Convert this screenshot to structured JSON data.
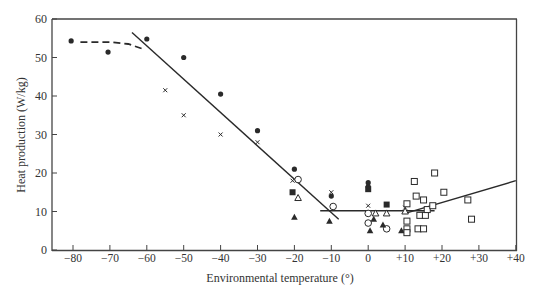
{
  "chart_data": {
    "type": "scatter",
    "title": "",
    "xlabel": "Environmental temperature (°)",
    "ylabel": "Heat production (W/kg)",
    "xlim": [
      -85,
      40
    ],
    "ylim": [
      0,
      60
    ],
    "grid": false,
    "legend": null,
    "x_ticks": [
      -80,
      -70,
      -60,
      -50,
      -40,
      -30,
      -20,
      -10,
      0,
      10,
      20,
      30,
      40
    ],
    "x_tick_labels": [
      "−80",
      "−70",
      "−60",
      "−50",
      "−40",
      "−30",
      "−20",
      "−10",
      "0",
      "+10",
      "+20",
      "+30",
      "+40"
    ],
    "y_ticks": [
      0,
      10,
      20,
      30,
      40,
      50,
      60
    ],
    "y_tick_labels": [
      "0",
      "10",
      "20",
      "30",
      "40",
      "50",
      "60"
    ],
    "series": [
      {
        "name": "filled-circle",
        "marker": "filled-circle",
        "points": [
          [
            -80.5,
            54.3
          ],
          [
            -70.5,
            51.4
          ],
          [
            -60,
            54.8
          ],
          [
            -50,
            50
          ],
          [
            -40,
            40.5
          ],
          [
            -30,
            31
          ],
          [
            -20,
            21
          ],
          [
            -10,
            14
          ],
          [
            0,
            17.5
          ],
          [
            0,
            16.5
          ]
        ]
      },
      {
        "name": "cross",
        "marker": "cross",
        "points": [
          [
            -55,
            41.5
          ],
          [
            -50,
            35
          ],
          [
            -40,
            30
          ],
          [
            -30,
            28
          ],
          [
            -20.5,
            18
          ],
          [
            -10,
            15
          ],
          [
            0,
            11.5
          ],
          [
            10,
            11
          ]
        ]
      },
      {
        "name": "open-circle",
        "marker": "open-circle",
        "points": [
          [
            -19,
            18.3
          ],
          [
            -9.5,
            11.3
          ],
          [
            0,
            9.5
          ],
          [
            0,
            7
          ],
          [
            5,
            5.5
          ]
        ]
      },
      {
        "name": "filled-square",
        "marker": "filled-square",
        "points": [
          [
            -20.5,
            15
          ],
          [
            0,
            15.8
          ],
          [
            5,
            11.8
          ]
        ]
      },
      {
        "name": "open-triangle",
        "marker": "open-triangle",
        "points": [
          [
            -19,
            13.5
          ],
          [
            2,
            9.5
          ],
          [
            5,
            9.5
          ],
          [
            10,
            10
          ]
        ]
      },
      {
        "name": "filled-triangle",
        "marker": "filled-triangle",
        "points": [
          [
            -20,
            8.5
          ],
          [
            -10.5,
            7.5
          ],
          [
            1.5,
            8
          ],
          [
            0.5,
            5
          ],
          [
            4,
            6.5
          ],
          [
            9,
            5
          ],
          [
            10.5,
            4.5
          ]
        ]
      },
      {
        "name": "open-square",
        "marker": "open-square",
        "points": [
          [
            10.5,
            12
          ],
          [
            10.5,
            7.5
          ],
          [
            10.5,
            5.5
          ],
          [
            10.5,
            4.5
          ],
          [
            12.5,
            17.8
          ],
          [
            13,
            14
          ],
          [
            14,
            9
          ],
          [
            13.5,
            5.5
          ],
          [
            15,
            13
          ],
          [
            15.5,
            9
          ],
          [
            15,
            5.5
          ],
          [
            16,
            10.5
          ],
          [
            17.5,
            11.5
          ],
          [
            18,
            20
          ],
          [
            20.5,
            15
          ],
          [
            27,
            13
          ],
          [
            28,
            8
          ]
        ]
      }
    ],
    "fit_lines": [
      {
        "name": "dashed-cold-plateau",
        "style": "dashed",
        "points": [
          [
            -78,
            54
          ],
          [
            -70,
            54
          ],
          [
            -65,
            53.5
          ],
          [
            -61,
            52.2
          ]
        ]
      },
      {
        "name": "metabolic-rise",
        "style": "solid",
        "points": [
          [
            -64,
            56.5
          ],
          [
            -8,
            8
          ]
        ]
      },
      {
        "name": "thermoneutral-zone",
        "style": "solid",
        "points": [
          [
            -13,
            10.2
          ],
          [
            18,
            10.2
          ]
        ]
      },
      {
        "name": "upper-rise",
        "style": "solid",
        "points": [
          [
            10,
            9.5
          ],
          [
            40,
            18
          ]
        ]
      }
    ]
  }
}
